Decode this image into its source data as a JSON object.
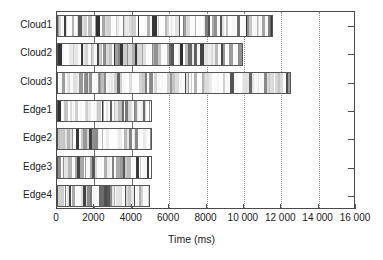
{
  "chart_data": {
    "type": "bar",
    "orientation": "horizontal",
    "title": "",
    "xlabel": "Time (ms)",
    "ylabel": "",
    "xlim": [
      0,
      16000
    ],
    "xticks": [
      0,
      2000,
      4000,
      6000,
      8000,
      10000,
      12000,
      14000,
      16000
    ],
    "xticklabels": [
      "0",
      "2000",
      "4000",
      "6000",
      "8000",
      "10 000",
      "12 000",
      "14 000",
      "16 000"
    ],
    "grid": "vertical-dotted",
    "legend": "none",
    "categories": [
      "Cloud1",
      "Cloud2",
      "Cloud3",
      "Edge1",
      "Edge2",
      "Edge3",
      "Edge4"
    ],
    "values": [
      11550,
      9950,
      12500,
      5100,
      5100,
      5100,
      4950
    ],
    "units": "ms",
    "note": "Each bar is filled with many thin vertical gray stripes representing individual task segments over time"
  },
  "axis": {
    "x_title": "Time (ms)",
    "tick_labels": [
      "0",
      "2000",
      "4000",
      "6000",
      "8000",
      "10 000",
      "12 000",
      "14 000",
      "16 000"
    ],
    "tick_values": [
      0,
      2000,
      4000,
      6000,
      8000,
      10000,
      12000,
      14000,
      16000
    ]
  },
  "rows": [
    {
      "label": "Cloud1",
      "end": 11550
    },
    {
      "label": "Cloud2",
      "end": 9950
    },
    {
      "label": "Cloud3",
      "end": 12500
    },
    {
      "label": "Edge1",
      "end": 5100
    },
    {
      "label": "Edge2",
      "end": 5100
    },
    {
      "label": "Edge3",
      "end": 5100
    },
    {
      "label": "Edge4",
      "end": 4950
    }
  ],
  "colors": {
    "frame": "#4a4a4a",
    "bar_border": "#555555",
    "grid_dotted": "#8a8a8a",
    "grid_solid": "#6b6b6b",
    "text": "#1a1a1a",
    "background": "#ffffff"
  }
}
